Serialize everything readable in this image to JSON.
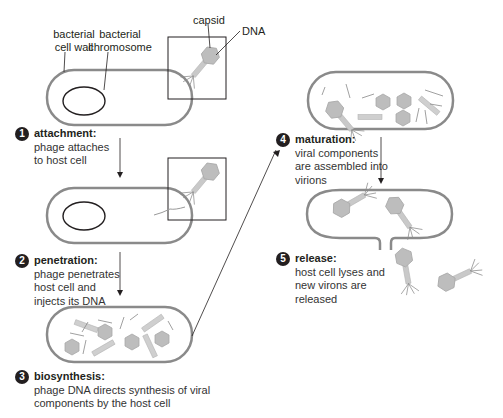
{
  "diagram": {
    "type": "lytic cycle of bacteriophage",
    "labels": {
      "cell_wall": "bacterial cell wall",
      "cell_wall_l1": "bacterial",
      "cell_wall_l2": "cell wall",
      "chromosome_l1": "bacterial",
      "chromosome_l2": "chromosome",
      "capsid": "capsid",
      "dna": "DNA"
    },
    "steps": [
      {
        "number": "1",
        "title": "attachment:",
        "desc": [
          "phage attaches",
          "to host cell"
        ]
      },
      {
        "number": "2",
        "title": "penetration:",
        "desc": [
          "phage penetrates",
          "host cell and",
          "injects its DNA"
        ]
      },
      {
        "number": "3",
        "title": "biosynthesis:",
        "desc": [
          "phage DNA directs synthesis of viral",
          "components by the host cell"
        ]
      },
      {
        "number": "4",
        "title": "maturation:",
        "desc": [
          "viral components",
          "are assembled into",
          "virions"
        ]
      },
      {
        "number": "5",
        "title": "release:",
        "desc": [
          "host cell lyses and",
          "new virons are",
          "released"
        ]
      }
    ],
    "colors": {
      "cell_wall": "#8a8a8a",
      "cell_fill": "#ffffff",
      "phage": "#c8c8c8",
      "step_badge": "#231f20",
      "text": "#231f20"
    }
  }
}
